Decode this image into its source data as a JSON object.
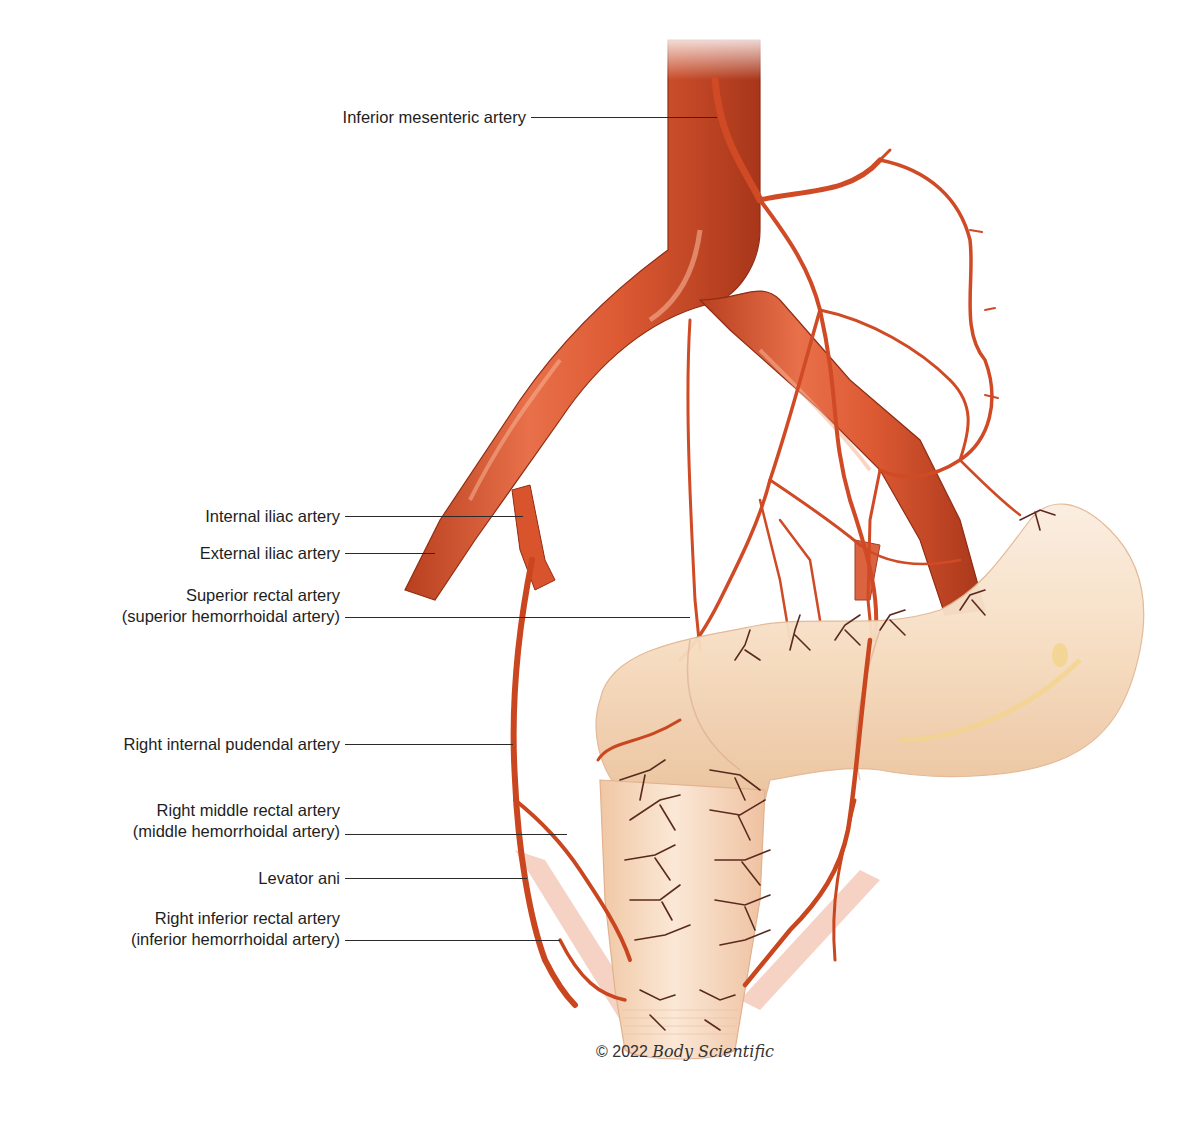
{
  "figure": {
    "colors": {
      "artery": "#d9532c",
      "artery_dark": "#a8361a",
      "artery_highlight": "#f19a78",
      "bowel": "#f6dcc0",
      "bowel_shadow": "#e9b98f",
      "small_vessel": "#5a2a1e",
      "levator": "#f3c3b1",
      "leader_line": "#2a2a2a",
      "background": "#ffffff"
    }
  },
  "labels": [
    {
      "id": "inferior-mesenteric",
      "lines": [
        "Inferior mesenteric artery"
      ]
    },
    {
      "id": "internal-iliac",
      "lines": [
        "Internal iliac artery"
      ]
    },
    {
      "id": "external-iliac",
      "lines": [
        "External iliac artery"
      ]
    },
    {
      "id": "superior-rectal",
      "lines": [
        "Superior rectal artery",
        "(superior hemorrhoidal artery)"
      ]
    },
    {
      "id": "right-internal-pudendal",
      "lines": [
        "Right internal pudendal artery"
      ]
    },
    {
      "id": "right-middle-rectal",
      "lines": [
        "Right middle rectal artery",
        "(middle hemorrhoidal artery)"
      ]
    },
    {
      "id": "levator-ani",
      "lines": [
        "Levator ani"
      ]
    },
    {
      "id": "right-inferior-rectal",
      "lines": [
        "Right inferior rectal artery",
        "(inferior hemorrhoidal artery)"
      ]
    }
  ],
  "copyright": {
    "prefix": "© 2022",
    "brand": "Body Scientific"
  }
}
